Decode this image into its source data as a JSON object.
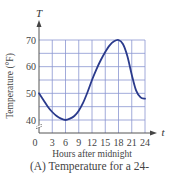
{
  "chart_data": {
    "type": "line",
    "title": "",
    "caption": "(A)  Temperature for a 24-",
    "xlabel": "Hours after midnight",
    "ylabel": "Temperature (°F)",
    "x_axis_var": "t",
    "y_axis_var": "T",
    "x_ticks": [
      0,
      3,
      6,
      9,
      12,
      15,
      18,
      21,
      24
    ],
    "y_ticks": [
      40,
      50,
      60,
      70
    ],
    "xlim": [
      0,
      24
    ],
    "ylim": [
      35,
      70
    ],
    "y_axis_break": true,
    "grid": true,
    "series": [
      {
        "name": "Temperature",
        "x": [
          0,
          1,
          2,
          3,
          4,
          5,
          6,
          7,
          8,
          9,
          10,
          11,
          12,
          13,
          14,
          15,
          16,
          17,
          18,
          19,
          20,
          21,
          22,
          23,
          24
        ],
        "values": [
          50,
          47.5,
          45,
          43,
          41.5,
          40.5,
          40,
          40.5,
          41.5,
          43.5,
          46.5,
          50.5,
          55,
          59,
          62.5,
          65.5,
          68,
          69.5,
          70,
          68.5,
          64,
          57,
          51,
          48.5,
          48
        ]
      }
    ],
    "colors": {
      "curve": "#2a3a8c",
      "grid": "#8a96d0",
      "axis": "#555555"
    }
  }
}
